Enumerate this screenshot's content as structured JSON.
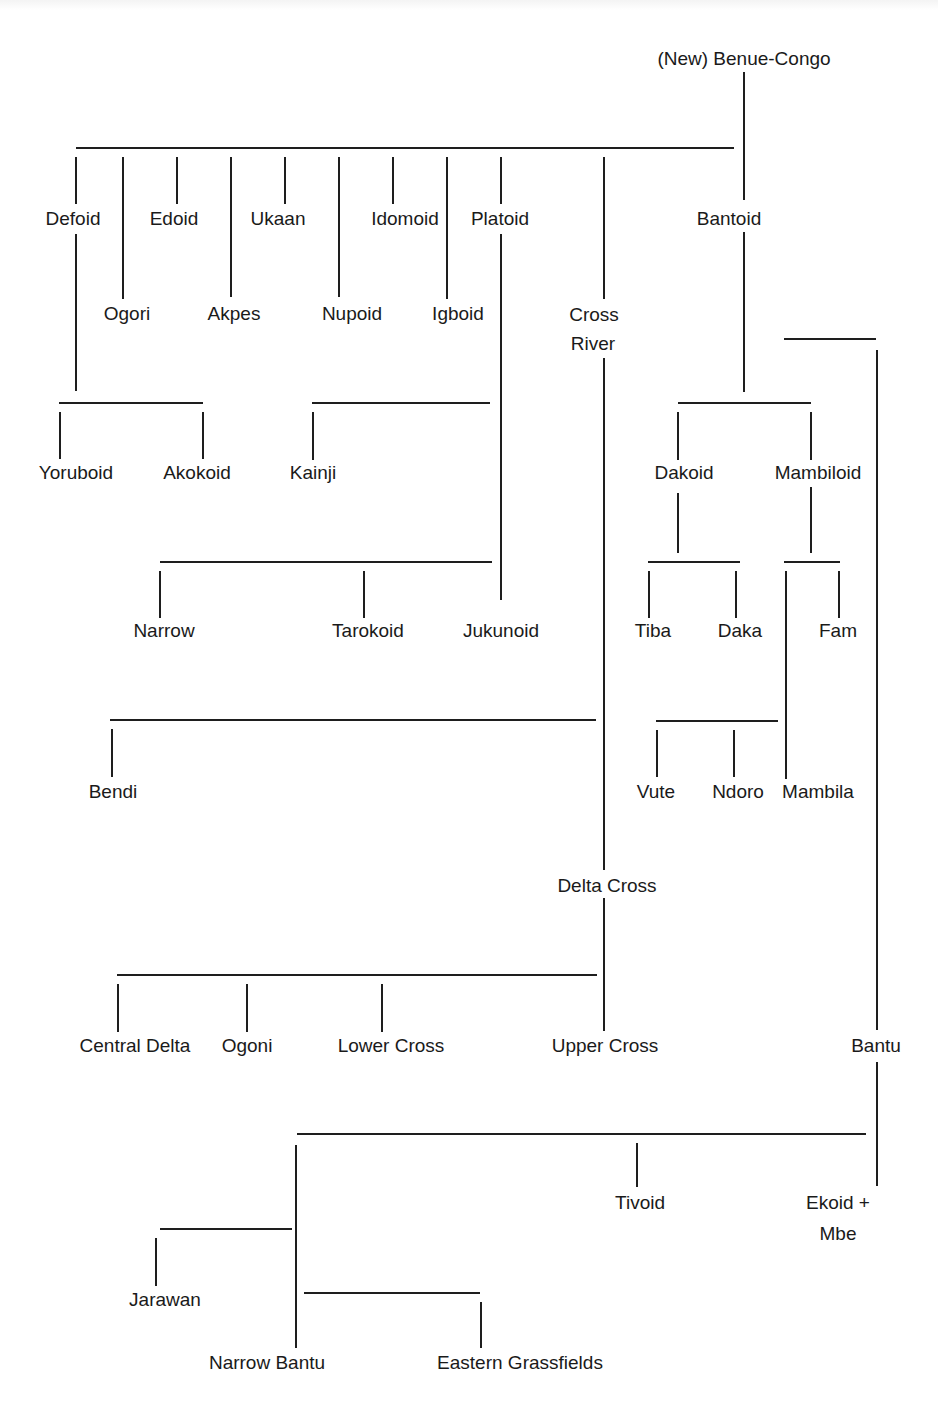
{
  "diagram": {
    "title": "(New) Benue-Congo",
    "type": "language family tree",
    "nodes": [
      {
        "id": "root",
        "label": "(New) Benue-Congo",
        "x": 744,
        "y": 44
      },
      {
        "id": "defoid",
        "label": "Defoid",
        "x": 73,
        "y": 204
      },
      {
        "id": "ogori",
        "label": "Ogori",
        "x": 127,
        "y": 299
      },
      {
        "id": "edoid",
        "label": "Edoid",
        "x": 174,
        "y": 204
      },
      {
        "id": "akpes",
        "label": "Akpes",
        "x": 234,
        "y": 299
      },
      {
        "id": "ukaan",
        "label": "Ukaan",
        "x": 278,
        "y": 204
      },
      {
        "id": "nupoid",
        "label": "Nupoid",
        "x": 352,
        "y": 299
      },
      {
        "id": "idomoid",
        "label": "Idomoid",
        "x": 405,
        "y": 204
      },
      {
        "id": "igboid",
        "label": "Igboid",
        "x": 458,
        "y": 299
      },
      {
        "id": "platoid",
        "label": "Platoid",
        "x": 500,
        "y": 204
      },
      {
        "id": "cross_river",
        "label": "Cross River",
        "lines": [
          "Cross",
          "River"
        ],
        "x": 594,
        "y": 299
      },
      {
        "id": "bantoid",
        "label": "Bantoid",
        "x": 729,
        "y": 204
      },
      {
        "id": "yoruboid",
        "label": "Yoruboid",
        "x": 76,
        "y": 458
      },
      {
        "id": "akokoid",
        "label": "Akokoid",
        "x": 197,
        "y": 458
      },
      {
        "id": "kainji",
        "label": "Kainji",
        "x": 313,
        "y": 458
      },
      {
        "id": "dakoid",
        "label": "Dakoid",
        "x": 684,
        "y": 458
      },
      {
        "id": "mambiloid",
        "label": "Mambiloid",
        "x": 818,
        "y": 458
      },
      {
        "id": "narrow",
        "label": "Narrow",
        "x": 164,
        "y": 616
      },
      {
        "id": "tarokoid",
        "label": "Tarokoid",
        "x": 368,
        "y": 616
      },
      {
        "id": "jukunoid",
        "label": "Jukunoid",
        "x": 501,
        "y": 616
      },
      {
        "id": "tiba",
        "label": "Tiba",
        "x": 653,
        "y": 616
      },
      {
        "id": "daka",
        "label": "Daka",
        "x": 740,
        "y": 616
      },
      {
        "id": "fam",
        "label": "Fam",
        "x": 838,
        "y": 616
      },
      {
        "id": "bendi",
        "label": "Bendi",
        "x": 113,
        "y": 777
      },
      {
        "id": "vute",
        "label": "Vute",
        "x": 656,
        "y": 777
      },
      {
        "id": "ndoro",
        "label": "Ndoro",
        "x": 738,
        "y": 777
      },
      {
        "id": "mambila",
        "label": "Mambila",
        "x": 818,
        "y": 777
      },
      {
        "id": "delta_cross",
        "label": "Delta Cross",
        "x": 607,
        "y": 871
      },
      {
        "id": "central_delta",
        "label": "Central Delta",
        "x": 135,
        "y": 1031
      },
      {
        "id": "ogoni",
        "label": "Ogoni",
        "x": 247,
        "y": 1031
      },
      {
        "id": "lower_cross",
        "label": "Lower Cross",
        "x": 391,
        "y": 1031
      },
      {
        "id": "upper_cross",
        "label": "Upper Cross",
        "x": 605,
        "y": 1031
      },
      {
        "id": "bantu",
        "label": "Bantu",
        "x": 876,
        "y": 1031
      },
      {
        "id": "tivoid",
        "label": "Tivoid",
        "x": 640,
        "y": 1188
      },
      {
        "id": "ekoid_mbe",
        "label": "Ekoid + Mbe",
        "lines": [
          "Ekoid +",
          "Mbe"
        ],
        "x": 838,
        "y": 1188
      },
      {
        "id": "jarawan",
        "label": "Jarawan",
        "x": 165,
        "y": 1285
      },
      {
        "id": "narrow_bantu",
        "label": "Narrow Bantu",
        "x": 267,
        "y": 1348
      },
      {
        "id": "eastern_grassfields",
        "label": "Eastern Grassfields",
        "x": 520,
        "y": 1348
      }
    ],
    "edges": [
      [
        "root",
        "defoid"
      ],
      [
        "root",
        "ogori"
      ],
      [
        "root",
        "edoid"
      ],
      [
        "root",
        "akpes"
      ],
      [
        "root",
        "ukaan"
      ],
      [
        "root",
        "nupoid"
      ],
      [
        "root",
        "idomoid"
      ],
      [
        "root",
        "igboid"
      ],
      [
        "root",
        "platoid"
      ],
      [
        "root",
        "cross_river"
      ],
      [
        "root",
        "bantoid"
      ],
      [
        "defoid",
        "yoruboid"
      ],
      [
        "defoid",
        "akokoid"
      ],
      [
        "platoid",
        "kainji"
      ],
      [
        "platoid",
        "narrow"
      ],
      [
        "platoid",
        "tarokoid"
      ],
      [
        "platoid",
        "jukunoid"
      ],
      [
        "cross_river",
        "bendi"
      ],
      [
        "cross_river",
        "delta_cross"
      ],
      [
        "delta_cross",
        "central_delta"
      ],
      [
        "delta_cross",
        "ogoni"
      ],
      [
        "delta_cross",
        "lower_cross"
      ],
      [
        "delta_cross",
        "upper_cross"
      ],
      [
        "bantoid",
        "dakoid"
      ],
      [
        "bantoid",
        "mambiloid"
      ],
      [
        "bantoid",
        "bantu"
      ],
      [
        "dakoid",
        "tiba"
      ],
      [
        "dakoid",
        "daka"
      ],
      [
        "mambiloid",
        "mambila"
      ],
      [
        "mambiloid",
        "fam"
      ],
      [
        "mambila",
        "vute"
      ],
      [
        "mambila",
        "ndoro"
      ],
      [
        "bantu",
        "tivoid"
      ],
      [
        "bantu",
        "ekoid_mbe"
      ],
      [
        "bantu",
        "narrow_bantu"
      ],
      [
        "narrow_bantu",
        "jarawan"
      ],
      [
        "narrow_bantu",
        "eastern_grassfields"
      ]
    ]
  },
  "labels": {
    "root": "(New) Benue-Congo",
    "defoid": "Defoid",
    "ogori": "Ogori",
    "edoid": "Edoid",
    "akpes": "Akpes",
    "ukaan": "Ukaan",
    "nupoid": "Nupoid",
    "idomoid": "Idomoid",
    "igboid": "Igboid",
    "platoid": "Platoid",
    "cross_1": "Cross",
    "cross_2": "River",
    "bantoid": "Bantoid",
    "yoruboid": "Yoruboid",
    "akokoid": "Akokoid",
    "kainji": "Kainji",
    "dakoid": "Dakoid",
    "mambiloid": "Mambiloid",
    "narrow": "Narrow",
    "tarokoid": "Tarokoid",
    "jukunoid": "Jukunoid",
    "tiba": "Tiba",
    "daka": "Daka",
    "fam": "Fam",
    "bendi": "Bendi",
    "vute": "Vute",
    "ndoro": "Ndoro",
    "mambila": "Mambila",
    "delta_cross": "Delta Cross",
    "central_delta": "Central Delta",
    "ogoni": "Ogoni",
    "lower_cross": "Lower Cross",
    "upper_cross": "Upper Cross",
    "bantu": "Bantu",
    "tivoid": "Tivoid",
    "ekoid_1": "Ekoid +",
    "ekoid_2": "Mbe",
    "jarawan": "Jarawan",
    "narrow_bantu": "Narrow Bantu",
    "eastern_grassfields": "Eastern Grassfields"
  }
}
